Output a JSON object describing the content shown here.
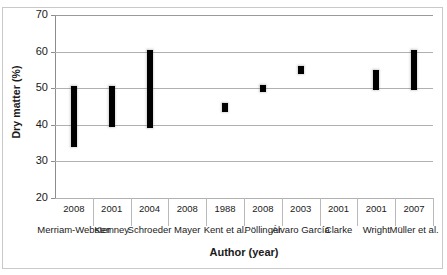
{
  "figure": {
    "title_remnant": "",
    "background_color": "#ffffff",
    "border_color": "#c9c9c9",
    "bar_color": "#000000",
    "gridline_color": "#b0b0b0",
    "axis_color": "#8d8d8d"
  },
  "axes": {
    "y_title": "Dry matter (%)",
    "x_title": "Author (year)",
    "y_ticks": [
      "70",
      "60",
      "50",
      "40",
      "30",
      "20"
    ]
  },
  "chart_data": {
    "type": "bar",
    "title": "",
    "subtitle": "",
    "xlabel": "Author (year)",
    "ylabel": "Dry matter (%)",
    "ylim": [
      20,
      70
    ],
    "ytick_values": [
      20,
      30,
      40,
      50,
      60,
      70
    ],
    "grid": true,
    "legend": "none",
    "orientation": "vertical",
    "note": "Floating range bars: each bar spans a minimum to maximum dry matter value reported by the cited author. Two categories (Mayer 2008, Clarke 2001) have no bar.",
    "categories": [
      "Merriam-Webster (2008)",
      "Kemney (2001)",
      "Schroeder (2004)",
      "Mayer (2008)",
      "Kent et al. (1988)",
      "Pöllinger (2008)",
      "Álvaro García (2003)",
      "Clarke (2001)",
      "Wright (2001)",
      "Müller et al. (2007)"
    ],
    "authors": [
      "Merriam-Webster",
      "Kemney",
      "Schroeder",
      "Mayer",
      "Kent et al.",
      "Pöllinger",
      "Álvaro García",
      "Clarke",
      "Wright",
      "Müller et al."
    ],
    "years": [
      "2008",
      "2001",
      "2004",
      "2008",
      "1988",
      "2008",
      "2003",
      "2001",
      "2001",
      "2007"
    ],
    "series": [
      {
        "name": "Dry matter range (%)",
        "low": [
          34.0,
          39.5,
          39.0,
          null,
          43.5,
          49.0,
          54.0,
          null,
          49.5,
          49.5
        ],
        "high": [
          50.5,
          50.5,
          60.5,
          null,
          46.0,
          51.0,
          56.0,
          null,
          55.0,
          60.5
        ]
      }
    ]
  },
  "bars": [
    {
      "category": "Merriam-Webster (2008)",
      "low": 34.0,
      "high": 50.5
    },
    {
      "category": "Kemney (2001)",
      "low": 39.5,
      "high": 50.5
    },
    {
      "category": "Schroeder (2004)",
      "low": 39.0,
      "high": 60.5
    },
    {
      "category": "Mayer (2008)",
      "low": null,
      "high": null
    },
    {
      "category": "Kent et al. (1988)",
      "low": 43.5,
      "high": 46.0
    },
    {
      "category": "Pöllinger (2008)",
      "low": 49.0,
      "high": 51.0
    },
    {
      "category": "Álvaro García (2003)",
      "low": 54.0,
      "high": 56.0
    },
    {
      "category": "Clarke (2001)",
      "low": null,
      "high": null
    },
    {
      "category": "Wright (2001)",
      "low": 49.5,
      "high": 55.0
    },
    {
      "category": "Müller et al. (2007)",
      "low": 49.5,
      "high": 60.5
    }
  ]
}
